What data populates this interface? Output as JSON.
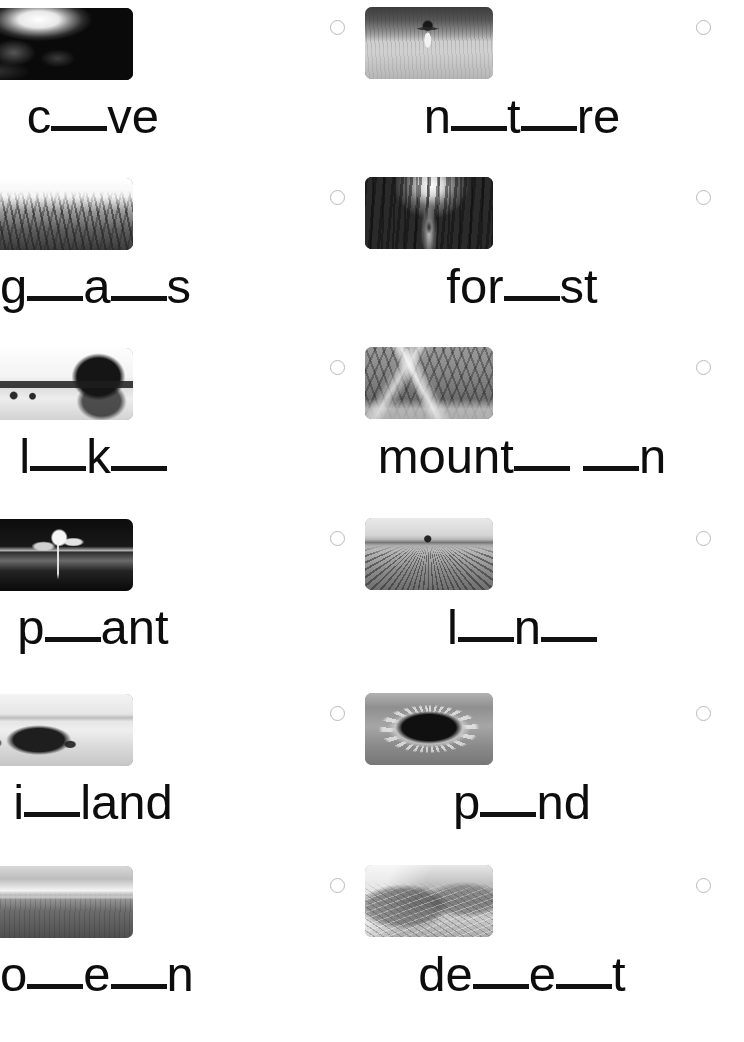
{
  "page": {
    "background_color": "#ffffff",
    "text_color": "#0d0d0d",
    "blank_color": "#111111",
    "bubble_border_color": "#b9b9b9",
    "columns": 2,
    "rows": 6
  },
  "items": [
    {
      "id": "cave",
      "column": "left",
      "row": 1,
      "image_name": "cave-photo",
      "image_alt": "Dark cave interior with a bright opening overhead",
      "art": "art-cave",
      "bubble_name": "option-bubble-cave",
      "word_display": "c__ve",
      "answer": "cave",
      "segments": [
        {
          "type": "text",
          "value": "c"
        },
        {
          "type": "blank",
          "size": "w2"
        },
        {
          "type": "text",
          "value": "ve"
        }
      ]
    },
    {
      "id": "nature",
      "column": "right",
      "row": 1,
      "image_name": "nature-photo",
      "image_alt": "Girl running with arms outstretched through a tall grassy field",
      "art": "art-nature",
      "bubble_name": "option-bubble-nature",
      "word_display": "n__t__re",
      "answer": "nature",
      "segments": [
        {
          "type": "text",
          "value": "n"
        },
        {
          "type": "blank",
          "size": "w2"
        },
        {
          "type": "text",
          "value": "t"
        },
        {
          "type": "blank",
          "size": "w2"
        },
        {
          "type": "text",
          "value": "re"
        }
      ]
    },
    {
      "id": "grass",
      "column": "left",
      "row": 2,
      "image_name": "grass-photo",
      "image_alt": "Close-up of tall grass blades",
      "art": "art-grass",
      "bubble_name": "option-bubble-grass",
      "word_display": "g__a__s",
      "answer": "grass",
      "segments": [
        {
          "type": "text",
          "value": "g"
        },
        {
          "type": "blank",
          "size": "w2"
        },
        {
          "type": "text",
          "value": "a"
        },
        {
          "type": "blank",
          "size": "w2"
        },
        {
          "type": "text",
          "value": "s"
        }
      ]
    },
    {
      "id": "forest",
      "column": "right",
      "row": 2,
      "image_name": "forest-photo",
      "image_alt": "Person walking a path through a dense sunlit forest",
      "art": "art-forest",
      "bubble_name": "option-bubble-forest",
      "word_display": "for__st",
      "answer": "forest",
      "segments": [
        {
          "type": "text",
          "value": "for"
        },
        {
          "type": "blank",
          "size": "w2"
        },
        {
          "type": "text",
          "value": "st"
        }
      ]
    },
    {
      "id": "lake",
      "column": "left",
      "row": 3,
      "image_name": "lake-photo",
      "image_alt": "Calm lake with trees reflected on the far shore",
      "art": "art-lake",
      "bubble_name": "option-bubble-lake",
      "word_display": "l__k__",
      "answer": "lake",
      "segments": [
        {
          "type": "text",
          "value": "l"
        },
        {
          "type": "blank",
          "size": "w2"
        },
        {
          "type": "text",
          "value": "k"
        },
        {
          "type": "blank",
          "size": "w2"
        }
      ]
    },
    {
      "id": "mountain",
      "column": "right",
      "row": 3,
      "image_name": "mountain-photo",
      "image_alt": "Jagged snow-capped mountain range",
      "art": "art-mountain",
      "bubble_name": "option-bubble-mountain",
      "word_display": "mount__ __n",
      "answer": "mountain",
      "segments": [
        {
          "type": "text",
          "value": "mount"
        },
        {
          "type": "blank",
          "size": "w2"
        },
        {
          "type": "gap"
        },
        {
          "type": "blank",
          "size": "w2"
        },
        {
          "type": "text",
          "value": "n"
        }
      ]
    },
    {
      "id": "plant",
      "column": "left",
      "row": 4,
      "image_name": "plant-photo",
      "image_alt": "Young seedling sprouting from dark soil",
      "art": "art-plant",
      "bubble_name": "option-bubble-plant",
      "word_display": "p__ant",
      "answer": "plant",
      "segments": [
        {
          "type": "text",
          "value": "p"
        },
        {
          "type": "blank",
          "size": "w2"
        },
        {
          "type": "text",
          "value": "ant"
        }
      ]
    },
    {
      "id": "land",
      "column": "right",
      "row": 4,
      "image_name": "land-photo",
      "image_alt": "Ploughed farmland with long furrows running to the horizon",
      "art": "art-land",
      "bubble_name": "option-bubble-land",
      "word_display": "l__n__",
      "answer": "land",
      "segments": [
        {
          "type": "text",
          "value": "l"
        },
        {
          "type": "blank",
          "size": "w2"
        },
        {
          "type": "text",
          "value": "n"
        },
        {
          "type": "blank",
          "size": "w2"
        }
      ]
    },
    {
      "id": "island",
      "column": "left",
      "row": 5,
      "image_name": "island-photo",
      "image_alt": "Small rocky island on pale calm water",
      "art": "art-island",
      "bubble_name": "option-bubble-island",
      "word_display": "i__land",
      "answer": "island",
      "segments": [
        {
          "type": "text",
          "value": "i"
        },
        {
          "type": "blank",
          "size": "w2"
        },
        {
          "type": "text",
          "value": "land"
        }
      ]
    },
    {
      "id": "pond",
      "column": "right",
      "row": 5,
      "image_name": "pond-photo",
      "image_alt": "Garden pond ringed with stones and plants",
      "art": "art-pond",
      "bubble_name": "option-bubble-pond",
      "word_display": "p__nd",
      "answer": "pond",
      "segments": [
        {
          "type": "text",
          "value": "p"
        },
        {
          "type": "blank",
          "size": "w2"
        },
        {
          "type": "text",
          "value": "nd"
        }
      ]
    },
    {
      "id": "ocean",
      "column": "left",
      "row": 6,
      "image_name": "ocean-photo",
      "image_alt": "Open sea under a bright overcast sky",
      "art": "art-ocean",
      "bubble_name": "option-bubble-ocean",
      "word_display": "o__e__n",
      "answer": "ocean",
      "segments": [
        {
          "type": "text",
          "value": "o"
        },
        {
          "type": "blank",
          "size": "w2"
        },
        {
          "type": "text",
          "value": "e"
        },
        {
          "type": "blank",
          "size": "w2"
        },
        {
          "type": "text",
          "value": "n"
        }
      ]
    },
    {
      "id": "desert",
      "column": "right",
      "row": 6,
      "image_name": "desert-photo",
      "image_alt": "Rippled sand dunes in a desert",
      "art": "art-desert",
      "bubble_name": "option-bubble-desert",
      "word_display": "de__e__t",
      "answer": "desert",
      "segments": [
        {
          "type": "text",
          "value": "de"
        },
        {
          "type": "blank",
          "size": "w2"
        },
        {
          "type": "text",
          "value": "e"
        },
        {
          "type": "blank",
          "size": "w2"
        },
        {
          "type": "text",
          "value": "t"
        }
      ]
    }
  ]
}
